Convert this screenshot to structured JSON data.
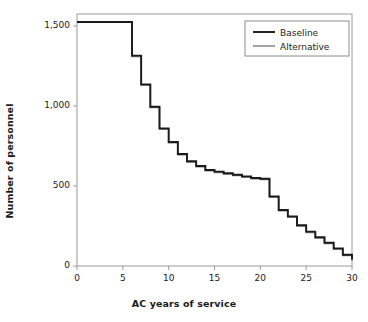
{
  "chart_data": {
    "type": "line",
    "subtype": "step",
    "title": "",
    "xlabel": "AC years of service",
    "ylabel": "Number of personnel",
    "xlim": [
      0,
      30
    ],
    "ylim": [
      0,
      1600
    ],
    "xticks": [
      0,
      5,
      10,
      15,
      20,
      25,
      30
    ],
    "xtick_labels": [
      "0",
      "5",
      "10",
      "15",
      "20",
      "25",
      "30"
    ],
    "yticks": [
      0,
      500,
      1000,
      1500
    ],
    "ytick_labels": [
      "0",
      "500",
      "1,000",
      "1,500"
    ],
    "grid": false,
    "legend_position": "top-right",
    "x": [
      0,
      1,
      2,
      3,
      4,
      5,
      6,
      7,
      8,
      9,
      10,
      11,
      12,
      13,
      14,
      15,
      16,
      17,
      18,
      19,
      20,
      21,
      22,
      23,
      24,
      25,
      26,
      27,
      28,
      29,
      30
    ],
    "series": [
      {
        "name": "Baseline",
        "color": "#1a1a1a",
        "values": [
          1525,
          1525,
          1525,
          1525,
          1525,
          1525,
          1315,
          1135,
          995,
          860,
          775,
          700,
          655,
          625,
          600,
          590,
          580,
          570,
          560,
          550,
          545,
          435,
          350,
          310,
          255,
          215,
          180,
          145,
          110,
          70,
          40
        ]
      },
      {
        "name": "Alternative",
        "color": "#808080",
        "values": [
          1525,
          1525,
          1525,
          1525,
          1525,
          1525,
          1310,
          1130,
          990,
          855,
          770,
          695,
          650,
          620,
          595,
          585,
          575,
          565,
          555,
          545,
          540,
          430,
          345,
          305,
          250,
          210,
          175,
          140,
          105,
          65,
          35
        ]
      }
    ]
  },
  "legend": {
    "entries": [
      {
        "label": "Baseline"
      },
      {
        "label": "Alternative"
      }
    ]
  },
  "colors": {
    "baseline": "#1a1a1a",
    "alternative": "#808080",
    "frame": "#9a9a9a",
    "background": "#ffffff"
  }
}
